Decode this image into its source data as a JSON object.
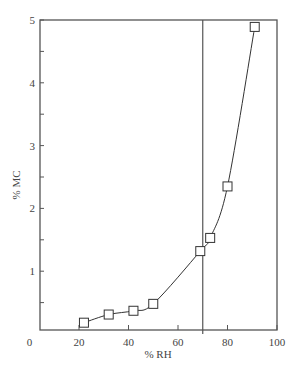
{
  "chart_data": {
    "type": "line",
    "title": "",
    "xlabel": "% RH",
    "ylabel": "% MC",
    "xlim": [
      0,
      100
    ],
    "ylim": [
      0.05,
      5
    ],
    "xticks": [
      0,
      20,
      40,
      60,
      80,
      100
    ],
    "xtick_labels": [
      "0",
      "20",
      "40",
      "60",
      "80",
      "100"
    ],
    "yticks": [
      1,
      2,
      3,
      4,
      5
    ],
    "ytick_labels": [
      "1",
      "2",
      "3",
      "4",
      "5"
    ],
    "grid": false,
    "legend": null,
    "markers": "open-square",
    "series": [
      {
        "name": "MC vs RH",
        "x": [
          22,
          32,
          42,
          50,
          69,
          73,
          80,
          91
        ],
        "y": [
          0.18,
          0.31,
          0.37,
          0.48,
          1.32,
          1.53,
          2.35,
          4.89
        ]
      }
    ],
    "annotations": [
      {
        "type": "vertical-line",
        "x": 70
      }
    ]
  },
  "colors": {
    "axis": "#555555",
    "line": "#333333",
    "marker_fill": "#ffffff"
  }
}
